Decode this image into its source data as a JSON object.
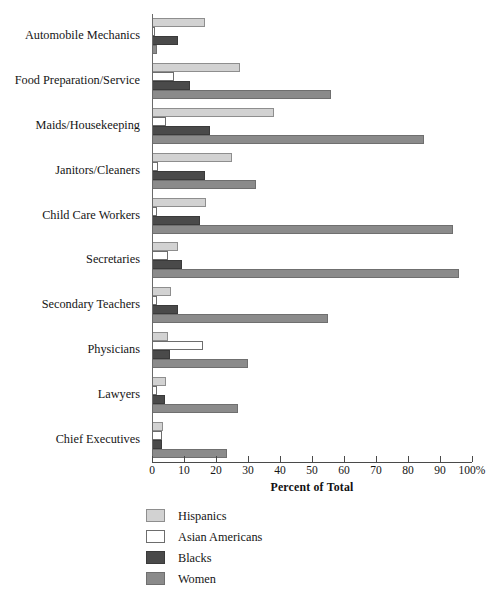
{
  "chart_data": {
    "type": "bar",
    "orientation": "horizontal",
    "title": "",
    "xlabel": "Percent of Total",
    "ylabel": "",
    "xlim": [
      0,
      100
    ],
    "xticks": [
      0,
      10,
      20,
      30,
      40,
      50,
      60,
      70,
      80,
      90,
      100
    ],
    "xtick_labels": [
      "0",
      "10",
      "20",
      "30",
      "40",
      "50",
      "60",
      "70",
      "80",
      "90",
      "100%"
    ],
    "grid": false,
    "legend_position": "bottom-left",
    "categories": [
      "Automobile Mechanics",
      "Food Preparation/Service",
      "Maids/Housekeeping",
      "Janitors/Cleaners",
      "Child Care Workers",
      "Secretaries",
      "Secondary Teachers",
      "Physicians",
      "Lawyers",
      "Chief Executives"
    ],
    "series": [
      {
        "name": "Hispanics",
        "color": "#d2d2d2",
        "values": [
          16.5,
          27.5,
          38,
          25,
          17,
          8,
          6,
          5,
          4.5,
          3.5
        ]
      },
      {
        "name": "Asian Americans",
        "color": "#ffffff",
        "values": [
          1,
          7,
          4.5,
          2,
          1.5,
          5,
          1.5,
          16,
          1.5,
          3
        ]
      },
      {
        "name": "Blacks",
        "color": "#4a4a4a",
        "values": [
          8,
          12,
          18,
          16.5,
          15,
          9.5,
          8,
          5.5,
          4,
          3
        ]
      },
      {
        "name": "Women",
        "color": "#8b8b8b",
        "values": [
          1.5,
          56,
          85,
          32.5,
          94,
          96,
          55,
          30,
          27,
          23.5
        ]
      }
    ]
  },
  "legend": {
    "entries": [
      {
        "label": "Hispanics"
      },
      {
        "label": "Asian Americans"
      },
      {
        "label": "Blacks"
      },
      {
        "label": "Women"
      }
    ]
  }
}
